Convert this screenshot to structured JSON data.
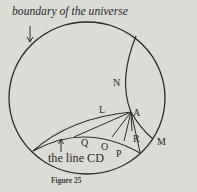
{
  "figure": {
    "caption": "Figure 25",
    "annotations": {
      "boundary": "boundary of the universe",
      "line_cd": "the line CD"
    },
    "points": {
      "A": "A",
      "L": "L",
      "N": "N",
      "M": "M",
      "Q": "Q",
      "O": "O",
      "P": "P",
      "R": "R"
    },
    "colors": {
      "background": "#dcdcd7",
      "ink": "#2a2a2a"
    }
  }
}
